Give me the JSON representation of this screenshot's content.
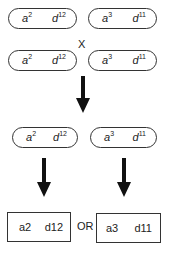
{
  "parents": {
    "row1": [
      {
        "allele_a": "a",
        "sup_a": "2",
        "allele_d": "d",
        "sup_d": "12"
      },
      {
        "allele_a": "a",
        "sup_a": "3",
        "allele_d": "d",
        "sup_d": "11"
      }
    ],
    "cross_symbol": "X",
    "row2": [
      {
        "allele_a": "a",
        "sup_a": "2",
        "allele_d": "d",
        "sup_d": "12"
      },
      {
        "allele_a": "a",
        "sup_a": "3",
        "allele_d": "d",
        "sup_d": "11"
      }
    ]
  },
  "gametes": [
    {
      "allele_a": "a",
      "sup_a": "2",
      "allele_d": "d",
      "sup_d": "12"
    },
    {
      "allele_a": "a",
      "sup_a": "3",
      "allele_d": "d",
      "sup_d": "11"
    }
  ],
  "results": {
    "left": {
      "a": "a2",
      "d": "d12"
    },
    "connector": "OR",
    "right": {
      "a": "a3",
      "d": "d11"
    }
  },
  "colors": {
    "stroke": "#333333",
    "arrow": "#111111",
    "background": "#ffffff"
  }
}
